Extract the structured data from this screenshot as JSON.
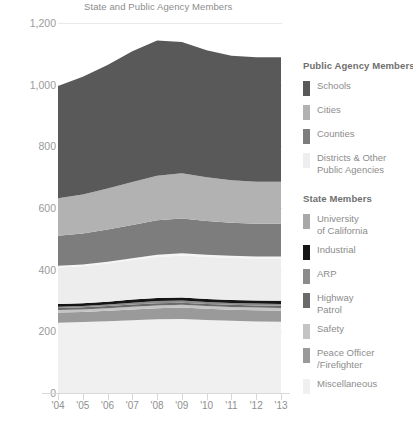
{
  "chart_data": {
    "type": "area",
    "title": "State and Public Agency Members",
    "xlabel": "",
    "ylabel": "",
    "ylim": [
      0,
      1200
    ],
    "yticks": [
      0,
      200,
      400,
      600,
      800,
      1000,
      1200
    ],
    "ytick_labels": [
      "0",
      "200",
      "400",
      "600",
      "800",
      "1,000",
      "1,200"
    ],
    "grid": true,
    "stacked": true,
    "legend_position": "right",
    "categories": [
      "'04",
      "'05",
      "'06",
      "'07",
      "'08",
      "'09",
      "'10",
      "'11",
      "'12",
      "'13"
    ],
    "x": [
      "'04",
      "'05",
      "'06",
      "'07",
      "'08",
      "'09",
      "'10",
      "'11",
      "'12",
      "'13"
    ],
    "series": [
      {
        "name": "Miscellaneous",
        "group": "State Members",
        "color": "#f0f0f0",
        "values": [
          228,
          230,
          233,
          236,
          239,
          240,
          237,
          234,
          232,
          231
        ]
      },
      {
        "name": "Peace Officer/Firefighter",
        "group": "State Members",
        "color": "#9a9a9a",
        "values": [
          33,
          33,
          34,
          35,
          36,
          37,
          36,
          36,
          36,
          36
        ]
      },
      {
        "name": "Safety",
        "group": "State Members",
        "color": "#c4c4c4",
        "values": [
          8,
          8,
          8,
          9,
          9,
          9,
          9,
          9,
          9,
          9
        ]
      },
      {
        "name": "Highway Patrol",
        "group": "State Members",
        "color": "#6a6a6a",
        "values": [
          7,
          7,
          7,
          7,
          7,
          7,
          7,
          7,
          7,
          7
        ]
      },
      {
        "name": "ARP",
        "group": "State Members",
        "color": "#8c8c8c",
        "values": [
          4,
          4,
          5,
          6,
          7,
          7,
          6,
          6,
          6,
          6
        ]
      },
      {
        "name": "Industrial",
        "group": "State Members",
        "color": "#151515",
        "values": [
          9,
          9,
          9,
          10,
          10,
          10,
          10,
          10,
          10,
          10
        ]
      },
      {
        "name": "University of California",
        "group": "State Members",
        "color": "#ededed",
        "values": [
          118,
          120,
          124,
          128,
          133,
          136,
          136,
          136,
          136,
          137
        ]
      },
      {
        "name": "Districts & Other Public Agencies",
        "group": "Public Agency Members",
        "color": "#f5f5f5",
        "values": [
          6,
          6,
          6,
          6,
          7,
          7,
          7,
          7,
          7,
          7
        ]
      },
      {
        "name": "Counties",
        "group": "Public Agency Members",
        "color": "#7d7d7d",
        "values": [
          97,
          100,
          104,
          108,
          112,
          113,
          110,
          107,
          106,
          106
        ]
      },
      {
        "name": "Cities",
        "group": "Public Agency Members",
        "color": "#b2b2b2",
        "values": [
          122,
          127,
          133,
          139,
          145,
          147,
          142,
          138,
          136,
          136
        ]
      },
      {
        "name": "Schools",
        "group": "Public Agency Members",
        "color": "#595959",
        "values": [
          364,
          382,
          401,
          424,
          438,
          425,
          412,
          404,
          404,
          404
        ]
      }
    ],
    "totals": [
      996,
      1026,
      1064,
      1108,
      1143,
      1138,
      1112,
      1094,
      1089,
      1089
    ]
  },
  "legend": {
    "groups": [
      {
        "title": "Public Agency Members",
        "items": [
          {
            "label": "Schools",
            "color": "#595959"
          },
          {
            "label": "Cities",
            "color": "#b2b2b2"
          },
          {
            "label": "Counties",
            "color": "#7d7d7d"
          },
          {
            "label": "Districts & Other\nPublic Agencies",
            "color": "#eeeeee"
          }
        ]
      },
      {
        "title": "State Members",
        "items": [
          {
            "label": "University\nof California",
            "color": "#a8a8a8"
          },
          {
            "label": "Industrial",
            "color": "#151515"
          },
          {
            "label": "ARP",
            "color": "#8c8c8c"
          },
          {
            "label": "Highway\nPatrol",
            "color": "#6a6a6a"
          },
          {
            "label": "Safety",
            "color": "#c4c4c4"
          },
          {
            "label": "Peace Officer\n/Firefighter",
            "color": "#9a9a9a"
          },
          {
            "label": "Miscellaneous",
            "color": "#f0f0f0"
          }
        ]
      }
    ]
  },
  "axis": {
    "gridline_color": "#e9e9e9",
    "baseline_color": "#d8d8d8",
    "label_color": "#9a9a9a"
  }
}
